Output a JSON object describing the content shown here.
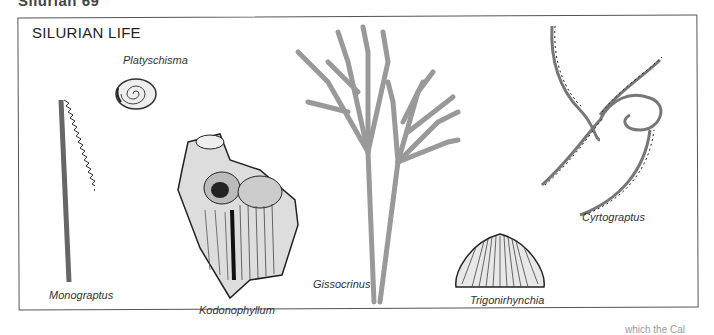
{
  "page_header": "Silurian   69",
  "figure": {
    "title": "SILURIAN LIFE",
    "specimens": [
      {
        "name": "Platyschisma",
        "type": "gastropod"
      },
      {
        "name": "Monograptus",
        "type": "graptolite"
      },
      {
        "name": "Kodonophyllum",
        "type": "coral"
      },
      {
        "name": "Gissocrinus",
        "type": "crinoid"
      },
      {
        "name": "Trigonirhynchia",
        "type": "brachiopod"
      },
      {
        "name": "Cyrtograptus",
        "type": "graptolite"
      }
    ]
  },
  "footer_fragment": "which the Cal"
}
